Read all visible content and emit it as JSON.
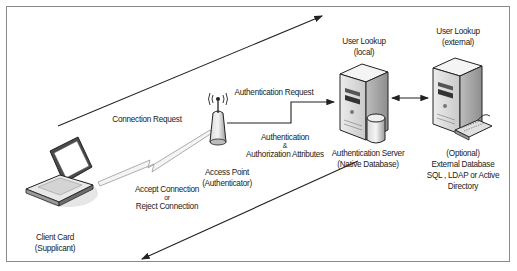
{
  "diagram": {
    "nodes": {
      "client": {
        "label_line1": "Client Card",
        "label_line2": "(Supplicant)",
        "icon": "laptop-icon"
      },
      "access_point": {
        "label_line1": "Access Point",
        "label_line2": "(Authenticator)",
        "icon": "wireless-access-point-icon"
      },
      "auth_server": {
        "label_line1": "Authentication Server",
        "label_line2": "(Native Database)",
        "heading_line1": "User Lookup",
        "heading_line2": "(local)",
        "icon": "server-with-database-icon"
      },
      "external_db": {
        "label_line1": "(Optional)",
        "label_line2": "External Database",
        "label_line3": "SQL , LDAP or Active",
        "label_line4": "Directory",
        "heading_line1": "User Lookup",
        "heading_line2": "(external)",
        "icon": "server-with-keyboard-icon"
      }
    },
    "edges": {
      "connection_request": "Connection Request",
      "authentication_request": "Authentication Request",
      "auth_attributes_line1": "Authentication",
      "auth_attributes_line2": "&",
      "auth_attributes_line3": "Authorization Attributes",
      "accept_line1": "Accept Connection",
      "accept_line2": "or",
      "accept_line3": "Reject Connection"
    },
    "colors": {
      "line": "#222222",
      "frame": "#8a8a8a",
      "server_light": "#f2f2f2",
      "server_mid": "#cfcfcf",
      "server_dark": "#8e8e8e"
    }
  }
}
